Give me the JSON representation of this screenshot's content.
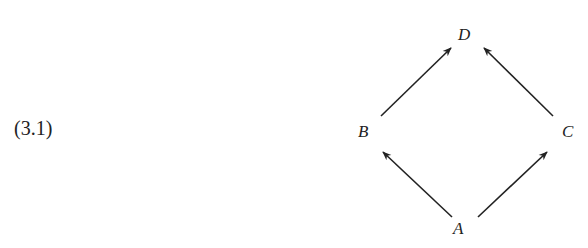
{
  "equation_number": "(3.1)",
  "diagram": {
    "nodes": [
      {
        "id": "D",
        "label": "D",
        "x": 458,
        "y": 26
      },
      {
        "id": "B",
        "label": "B",
        "x": 358,
        "y": 123
      },
      {
        "id": "C",
        "label": "C",
        "x": 562,
        "y": 123
      },
      {
        "id": "A",
        "label": "A",
        "x": 453,
        "y": 220
      }
    ],
    "edges": [
      {
        "from": "B",
        "to": "D"
      },
      {
        "from": "C",
        "to": "D"
      },
      {
        "from": "A",
        "to": "B"
      },
      {
        "from": "A",
        "to": "C"
      }
    ],
    "stroke_color": "#222222"
  }
}
